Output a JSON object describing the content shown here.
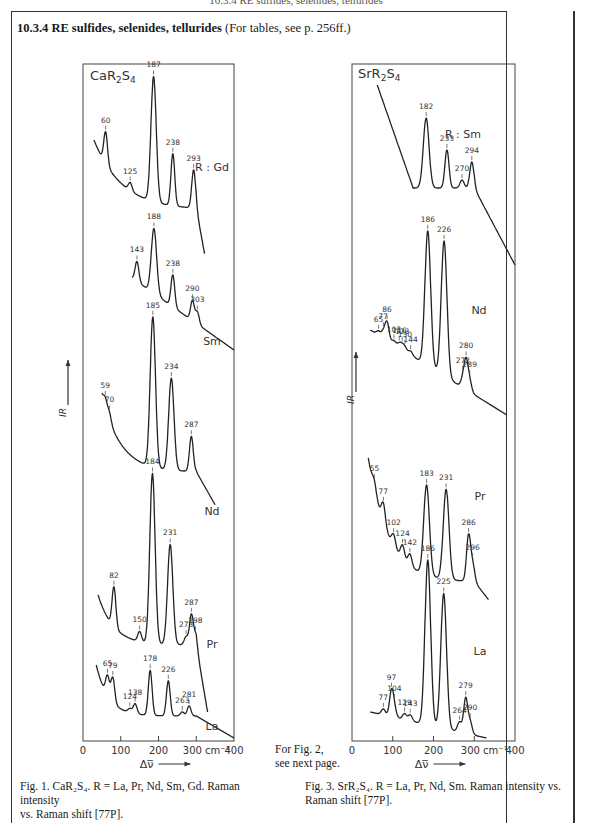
{
  "page": {
    "running_head": "10.3.4 RE sulfides, selenides, tellurides",
    "section_number": "10.3.4",
    "section_title": "RE sulfides, selenides, tellurides",
    "section_note": "(For tables, see p. 256ff.)",
    "middle_note_line1": "For Fig. 2,",
    "middle_note_line2": "see next page."
  },
  "figures": {
    "fig1": {
      "compound_label": "CaR2S4",
      "caption_line1": "Fig. 1.  CaR₂S₄.  R = La, Pr, Nd, Sm, Gd. Raman intensity",
      "caption_line2": "vs. Raman shift [77P]."
    },
    "fig3": {
      "compound_label": "SrR2S4",
      "caption_line1": "Fig. 3.  SrR₂S₄.  R = La, Pr, Nd, Sm. Raman intensity vs.",
      "caption_line2": "Raman shift [77P]."
    }
  },
  "chart_data": [
    {
      "type": "line",
      "title": "CaR2S4",
      "xlabel": "Δν̅",
      "ylabel": "I_R",
      "x_unit": "cm-1",
      "xlim": [
        0,
        400
      ],
      "x_ticks": [
        0,
        100,
        200,
        300,
        400
      ],
      "x_tick_labels": [
        "0",
        "100",
        "200",
        "300 cm⁻¹",
        "400"
      ],
      "grid": false,
      "legend_prefix": "R :",
      "series": [
        {
          "name": "Gd",
          "peaks": [
            60,
            125,
            187,
            238,
            293
          ]
        },
        {
          "name": "Sm",
          "peaks": [
            143,
            188,
            238,
            290,
            303
          ]
        },
        {
          "name": "Nd",
          "peaks": [
            59,
            70,
            185,
            234,
            287
          ]
        },
        {
          "name": "Pr",
          "peaks": [
            82,
            150,
            184,
            231,
            273,
            287,
            298
          ]
        },
        {
          "name": "La",
          "peaks": [
            65,
            79,
            124,
            138,
            178,
            226,
            263,
            281
          ]
        }
      ]
    },
    {
      "type": "line",
      "title": "SrR2S4",
      "xlabel": "Δν̅",
      "ylabel": "I_R",
      "x_unit": "cm-1",
      "xlim": [
        0,
        400
      ],
      "x_ticks": [
        0,
        100,
        200,
        300,
        400
      ],
      "x_tick_labels": [
        "0",
        "100",
        "200",
        "300 cm⁻¹",
        "400"
      ],
      "grid": false,
      "legend_prefix": "R :",
      "series": [
        {
          "name": "Sm",
          "peaks": [
            182,
            233,
            270,
            294
          ]
        },
        {
          "name": "Nd",
          "peaks": [
            65,
            77,
            86,
            103,
            116,
            123,
            130,
            144,
            186,
            226,
            272,
            280,
            289
          ]
        },
        {
          "name": "Pr",
          "peaks": [
            55,
            77,
            102,
            124,
            142,
            183,
            231,
            286,
            296
          ]
        },
        {
          "name": "La",
          "peaks": [
            77,
            97,
            104,
            129,
            143,
            186,
            225,
            264,
            279,
            290
          ]
        }
      ]
    }
  ]
}
